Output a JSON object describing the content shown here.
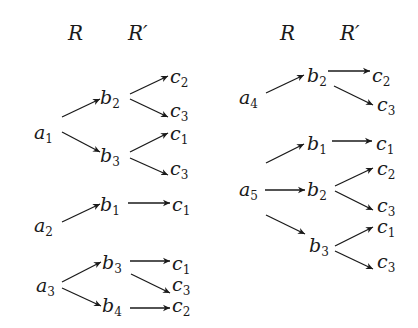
{
  "headers": {
    "left": {
      "R": "R",
      "Rp": "R′"
    },
    "right": {
      "R": "R",
      "Rp": "R′"
    }
  },
  "nodes": {
    "g1": {
      "a": [
        "a",
        "1"
      ],
      "b_top": [
        "b",
        "2"
      ],
      "b_bot": [
        "b",
        "3"
      ],
      "c1": [
        "c",
        "2"
      ],
      "c2": [
        "c",
        "3"
      ],
      "c3": [
        "c",
        "1"
      ],
      "c4": [
        "c",
        "3"
      ]
    },
    "g2": {
      "a": [
        "a",
        "2"
      ],
      "b": [
        "b",
        "1"
      ],
      "c": [
        "c",
        "1"
      ]
    },
    "g3": {
      "a": [
        "a",
        "3"
      ],
      "b_top": [
        "b",
        "3"
      ],
      "b_bot": [
        "b",
        "4"
      ],
      "c1": [
        "c",
        "1"
      ],
      "c2": [
        "c",
        "3"
      ],
      "c3": [
        "c",
        "2"
      ]
    },
    "g4": {
      "a": [
        "a",
        "4"
      ],
      "b": [
        "b",
        "2"
      ],
      "c1": [
        "c",
        "2"
      ],
      "c2": [
        "c",
        "3"
      ]
    },
    "g5": {
      "a": [
        "a",
        "5"
      ],
      "b1": [
        "b",
        "1"
      ],
      "b2": [
        "b",
        "2"
      ],
      "b3": [
        "b",
        "3"
      ],
      "c1": [
        "c",
        "1"
      ],
      "c2": [
        "c",
        "2"
      ],
      "c3": [
        "c",
        "3"
      ],
      "c4": [
        "c",
        "1"
      ],
      "c5": [
        "c",
        "3"
      ]
    }
  },
  "relations": {
    "R": [
      [
        "a1",
        "b2"
      ],
      [
        "a1",
        "b3"
      ],
      [
        "a2",
        "b1"
      ],
      [
        "a3",
        "b3"
      ],
      [
        "a3",
        "b4"
      ],
      [
        "a4",
        "b2"
      ],
      [
        "a5",
        "b1"
      ],
      [
        "a5",
        "b2"
      ],
      [
        "a5",
        "b3"
      ]
    ],
    "R_prime_group_edges": {
      "g1": [
        [
          "b2",
          "c2"
        ],
        [
          "b2",
          "c3"
        ],
        [
          "b3",
          "c1"
        ],
        [
          "b3",
          "c3"
        ]
      ],
      "g2": [
        [
          "b1",
          "c1"
        ]
      ],
      "g3": [
        [
          "b3",
          "c1"
        ],
        [
          "b3",
          "c3"
        ],
        [
          "b4",
          "c2"
        ]
      ],
      "g4": [
        [
          "b2",
          "c2"
        ],
        [
          "b2",
          "c3"
        ]
      ],
      "g5": [
        [
          "b1",
          "c1"
        ],
        [
          "b2",
          "c2"
        ],
        [
          "b2",
          "c3"
        ],
        [
          "b3",
          "c1"
        ],
        [
          "b3",
          "c3"
        ]
      ]
    }
  }
}
